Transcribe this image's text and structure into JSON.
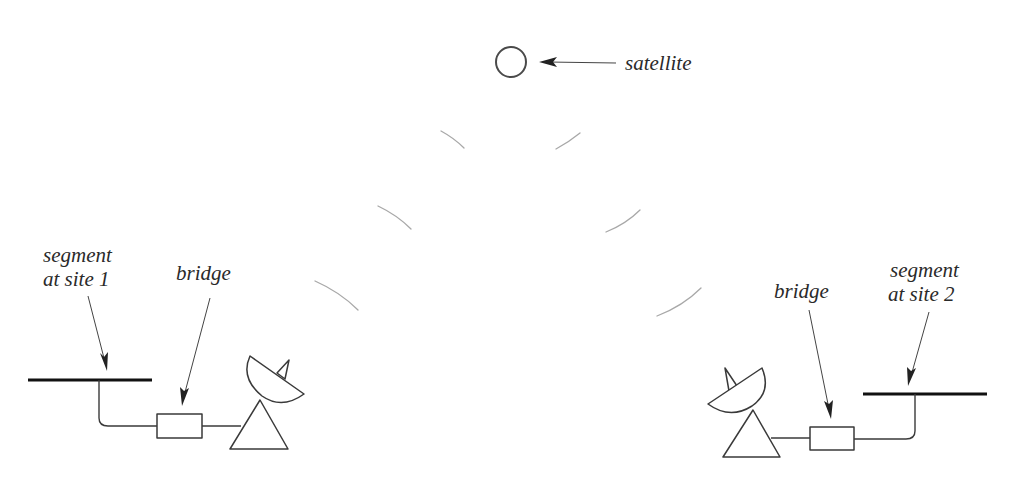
{
  "diagram": {
    "labels": {
      "satellite": "satellite",
      "left_segment_line1": "segment",
      "left_segment_line2": "at site 1",
      "left_bridge": "bridge",
      "right_bridge": "bridge",
      "right_segment_line1": "segment",
      "right_segment_line2": "at site 2"
    },
    "nodes": [
      {
        "id": "satellite",
        "type": "satellite",
        "center": [
          511,
          62
        ],
        "radius": 15
      },
      {
        "id": "segment-site-1",
        "type": "lan-segment",
        "x1": 28,
        "x2": 152,
        "y": 380
      },
      {
        "id": "bridge-site-1",
        "type": "bridge",
        "x": 157,
        "y": 414,
        "w": 45,
        "h": 24
      },
      {
        "id": "antenna-site-1",
        "type": "satellite-dish",
        "facing": "up-right"
      },
      {
        "id": "antenna-site-2",
        "type": "satellite-dish",
        "facing": "up-left"
      },
      {
        "id": "bridge-site-2",
        "type": "bridge",
        "x": 810,
        "y": 427,
        "w": 44,
        "h": 23
      },
      {
        "id": "segment-site-2",
        "type": "lan-segment",
        "x1": 863,
        "x2": 987,
        "y": 394
      }
    ],
    "links": [
      {
        "from": "segment-site-1",
        "to": "bridge-site-1",
        "kind": "wire"
      },
      {
        "from": "bridge-site-1",
        "to": "antenna-site-1",
        "kind": "wire"
      },
      {
        "from": "antenna-site-1",
        "to": "satellite",
        "kind": "radio-uplink"
      },
      {
        "from": "satellite",
        "to": "antenna-site-2",
        "kind": "radio-downlink"
      },
      {
        "from": "antenna-site-2",
        "to": "bridge-site-2",
        "kind": "wire"
      },
      {
        "from": "bridge-site-2",
        "to": "segment-site-2",
        "kind": "wire"
      }
    ],
    "colors": {
      "stroke": "#3a3a3a",
      "segment": "#111111",
      "radio_wave": "#a8a8a8",
      "text": "#2a2a2a",
      "background": "#ffffff"
    }
  }
}
